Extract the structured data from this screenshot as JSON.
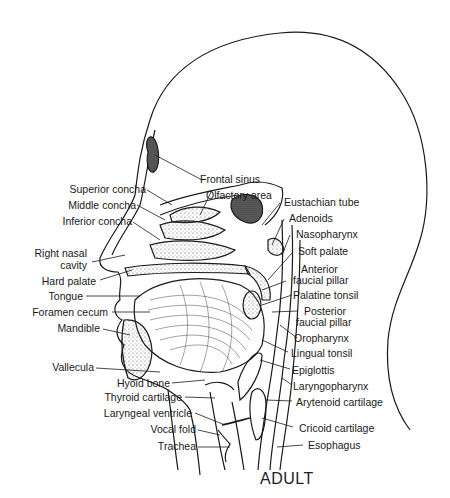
{
  "figure": {
    "title": "ADULT",
    "stroke_color": "#1a1a1a",
    "background": "#ffffff"
  },
  "labels": {
    "left": [
      {
        "id": "superior-concha",
        "text": "Superior concha"
      },
      {
        "id": "middle-concha",
        "text": "Middle concha"
      },
      {
        "id": "inferior-concha",
        "text": "Inferior concha"
      },
      {
        "id": "right-nasal-cavity-1",
        "text": "Right nasal"
      },
      {
        "id": "right-nasal-cavity-2",
        "text": "cavity"
      },
      {
        "id": "hard-palate",
        "text": "Hard palate"
      },
      {
        "id": "tongue",
        "text": "Tongue"
      },
      {
        "id": "foramen-cecum",
        "text": "Foramen cecum"
      },
      {
        "id": "mandible",
        "text": "Mandible"
      },
      {
        "id": "vallecula",
        "text": "Vallecula"
      },
      {
        "id": "hyoid-bone",
        "text": "Hyoid bone"
      },
      {
        "id": "thyroid-cartilage",
        "text": "Thyroid cartilage"
      },
      {
        "id": "laryngeal-ventricle",
        "text": "Laryngeal ventricle"
      },
      {
        "id": "vocal-fold",
        "text": "Vocal fold"
      },
      {
        "id": "trachea",
        "text": "Trachea"
      }
    ],
    "top": [
      {
        "id": "frontal-sinus",
        "text": "Frontal sinus"
      },
      {
        "id": "olfactory-area",
        "text": "Olfactory area"
      }
    ],
    "right": [
      {
        "id": "eustachian-tube",
        "text": "Eustachian tube"
      },
      {
        "id": "adenoids",
        "text": "Adenoids"
      },
      {
        "id": "nasopharynx",
        "text": "Nasopharynx"
      },
      {
        "id": "soft-palate",
        "text": "Soft palate"
      },
      {
        "id": "anterior-faucial-pillar-1",
        "text": "Anterior"
      },
      {
        "id": "anterior-faucial-pillar-2",
        "text": "faucial pillar"
      },
      {
        "id": "palatine-tonsil",
        "text": "Palatine tonsil"
      },
      {
        "id": "posterior-faucial-pillar-1",
        "text": "Posterior"
      },
      {
        "id": "posterior-faucial-pillar-2",
        "text": "faucial pillar"
      },
      {
        "id": "oropharynx",
        "text": "Oropharynx"
      },
      {
        "id": "lingual-tonsil",
        "text": "Lingual tonsil"
      },
      {
        "id": "epiglottis",
        "text": "Epiglottis"
      },
      {
        "id": "laryngopharynx",
        "text": "Laryngopharynx"
      },
      {
        "id": "arytenoid-cartilage",
        "text": "Arytenoid cartilage"
      },
      {
        "id": "cricoid-cartilage",
        "text": "Cricoid cartilage"
      },
      {
        "id": "esophagus",
        "text": "Esophagus"
      }
    ]
  }
}
